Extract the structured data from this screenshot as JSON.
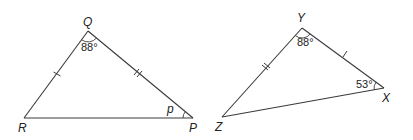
{
  "diagram": {
    "type": "geometry-triangles",
    "triangles": [
      {
        "name": "triangle-QRP",
        "vertices": {
          "Q": {
            "label": "Q",
            "x": 88,
            "y": 31
          },
          "R": {
            "label": "R",
            "x": 24,
            "y": 118
          },
          "P": {
            "label": "P",
            "x": 193,
            "y": 118
          }
        },
        "angles": {
          "Q": "88°",
          "P": "p"
        },
        "tick_marks": {
          "QR": 1,
          "QP": 2
        }
      },
      {
        "name": "triangle-YZX",
        "vertices": {
          "Y": {
            "label": "Y",
            "x": 302,
            "y": 28
          },
          "Z": {
            "label": "Z",
            "x": 222,
            "y": 117
          },
          "X": {
            "label": "X",
            "x": 384,
            "y": 88
          }
        },
        "angles": {
          "Y": "88°",
          "X": "53°"
        },
        "tick_marks": {
          "YZ": 2,
          "YX": 1
        }
      }
    ],
    "colors": {
      "line": "#3a3a3a",
      "text": "#222222",
      "background": "#ffffff"
    }
  }
}
